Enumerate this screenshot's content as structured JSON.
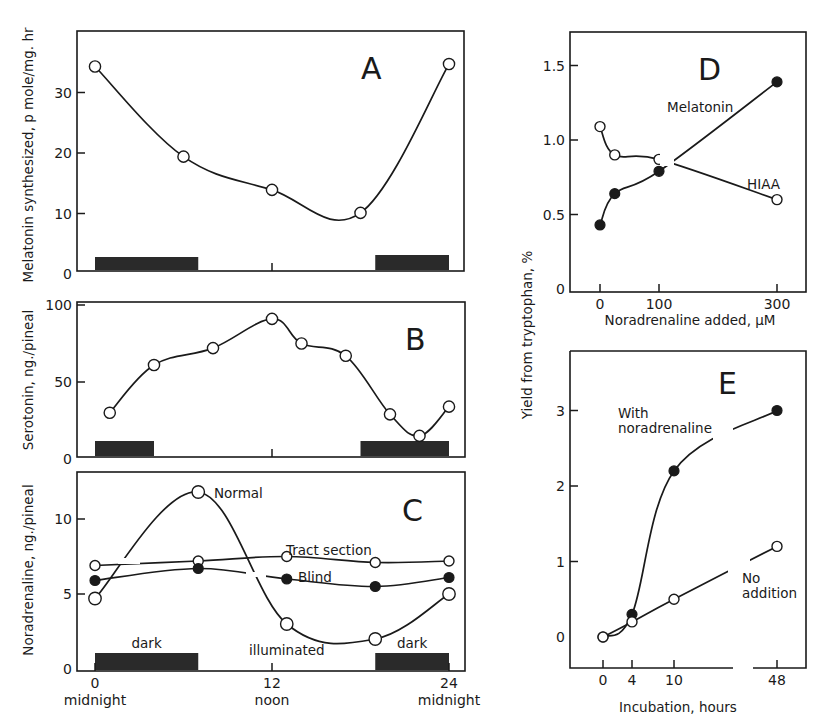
{
  "figure": {
    "shared_ylabel_right": "Yield from tryptophan, %"
  },
  "chart_data": [
    {
      "id": "A",
      "type": "line",
      "panel_label": "A",
      "ylabel": "Melatonin synthesized, p mole/mg. hr",
      "xlabel": "",
      "xlim": [
        0,
        24
      ],
      "ylim": [
        0,
        40
      ],
      "yticks": [
        0,
        10,
        20,
        30
      ],
      "ytick_labels": [
        "0",
        "10",
        "20",
        "30"
      ],
      "xticks": [
        12
      ],
      "xtick_labels": [],
      "grid": false,
      "dark_periods": [
        [
          0,
          7
        ],
        [
          19,
          24
        ]
      ],
      "series": [
        {
          "name": "Melatonin",
          "marker": "open",
          "x": [
            0,
            6,
            12,
            18,
            24
          ],
          "y": [
            34.3,
            19.4,
            13.9,
            10.1,
            34.7
          ]
        }
      ]
    },
    {
      "id": "B",
      "type": "line",
      "panel_label": "B",
      "ylabel": "Serotonin, ng./pineal",
      "xlabel": "",
      "xlim": [
        0,
        24
      ],
      "ylim": [
        0,
        100
      ],
      "yticks": [
        0,
        50,
        100
      ],
      "ytick_labels": [
        "0",
        "50",
        "100"
      ],
      "xticks": [
        12
      ],
      "xtick_labels": [],
      "grid": false,
      "dark_periods": [
        [
          0,
          4
        ],
        [
          18,
          24
        ]
      ],
      "series": [
        {
          "name": "Serotonin",
          "marker": "open",
          "x": [
            1,
            4,
            8,
            12,
            14,
            17,
            20,
            22,
            24
          ],
          "y": [
            30,
            61,
            72,
            91,
            75,
            67,
            29,
            15,
            34
          ]
        }
      ]
    },
    {
      "id": "C",
      "type": "line",
      "panel_label": "C",
      "ylabel": "Noradrenaline, ng./pineal",
      "xlabel": "",
      "xlim": [
        0,
        24
      ],
      "ylim": [
        0,
        13
      ],
      "yticks": [
        0,
        5,
        10
      ],
      "ytick_labels": [
        "0",
        "5",
        "10"
      ],
      "xticks": [
        0,
        12,
        24
      ],
      "xtick_labels": [
        "0",
        "12",
        "24"
      ],
      "xtick_sublabels": [
        "midnight",
        "noon",
        "midnight"
      ],
      "grid": false,
      "dark_periods": [
        [
          0,
          7
        ],
        [
          19,
          24
        ]
      ],
      "period_labels": [
        {
          "text": "dark",
          "x": 3.5
        },
        {
          "text": "illuminated",
          "x": 13
        },
        {
          "text": "dark",
          "x": 21.5
        }
      ],
      "series": [
        {
          "name": "Normal",
          "marker": "open-large",
          "x": [
            0,
            7,
            13,
            19,
            24
          ],
          "y": [
            4.7,
            11.8,
            3.0,
            2.0,
            5.0
          ]
        },
        {
          "name": "Tract section",
          "marker": "open",
          "x": [
            0,
            7,
            13,
            19,
            24
          ],
          "y": [
            6.9,
            7.2,
            7.5,
            7.1,
            7.2
          ]
        },
        {
          "name": "Blind",
          "marker": "filled",
          "x": [
            0,
            7,
            13,
            19,
            24
          ],
          "y": [
            5.9,
            6.7,
            6.0,
            5.5,
            6.1
          ]
        }
      ]
    },
    {
      "id": "D",
      "type": "line",
      "panel_label": "D",
      "ylabel": "Yield from tryptophan, %",
      "xlabel": "Noradrenaline added, µM",
      "xlim": [
        -50,
        350
      ],
      "ylim": [
        0,
        1.7
      ],
      "yticks": [
        0,
        0.5,
        1.0,
        1.5
      ],
      "ytick_labels": [
        "0",
        "0.5",
        "1.0",
        "1.5"
      ],
      "xticks": [
        0,
        100,
        300
      ],
      "xtick_labels": [
        "0",
        "100",
        "300"
      ],
      "grid": false,
      "series": [
        {
          "name": "Melatonin",
          "marker": "filled",
          "x": [
            0,
            25,
            100,
            300
          ],
          "y": [
            0.43,
            0.64,
            0.79,
            1.39
          ]
        },
        {
          "name": "HIAA",
          "marker": "open",
          "x": [
            0,
            25,
            100,
            300
          ],
          "y": [
            1.09,
            0.9,
            0.87,
            0.6
          ]
        }
      ]
    },
    {
      "id": "E",
      "type": "line",
      "panel_label": "E",
      "ylabel": "Yield from tryptophan, %",
      "xlabel": "Incubation, hours",
      "xlim": [
        -2,
        50
      ],
      "ylim": [
        -0.4,
        3.8
      ],
      "yticks": [
        0,
        1,
        2,
        3
      ],
      "ytick_labels": [
        "0",
        "1",
        "2",
        "3"
      ],
      "xticks": [
        0,
        4,
        10,
        48
      ],
      "xtick_labels": [
        "0",
        "4",
        "10",
        "48"
      ],
      "x_axis_break": true,
      "grid": false,
      "series": [
        {
          "name": "With noradrenaline",
          "marker": "filled",
          "x": [
            0,
            4,
            10,
            48
          ],
          "y": [
            0,
            0.3,
            2.2,
            3.0
          ]
        },
        {
          "name": "No addition",
          "marker": "open",
          "x": [
            0,
            4,
            10,
            48
          ],
          "y": [
            0,
            0.2,
            0.5,
            1.2
          ]
        }
      ]
    }
  ],
  "annotations": {
    "A": [],
    "B": [],
    "C": [
      "Normal",
      "Tract section",
      "Blind"
    ],
    "D": [
      "Melatonin",
      "HIAA"
    ],
    "E": [
      "With",
      "noradrenaline",
      "No",
      "addition"
    ]
  }
}
